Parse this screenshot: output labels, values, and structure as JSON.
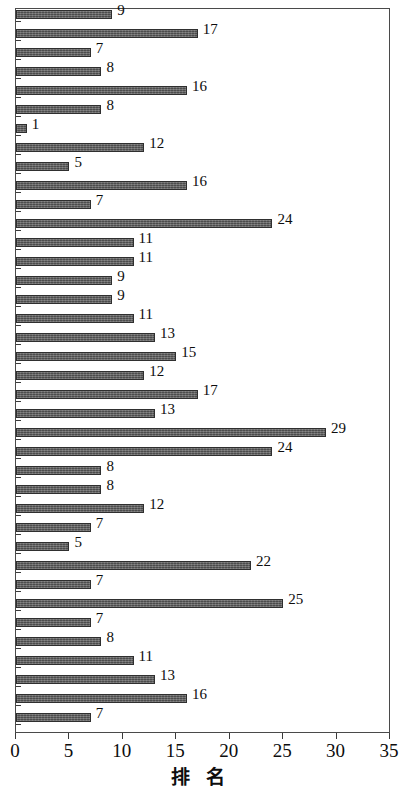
{
  "chart_data": {
    "type": "bar",
    "orientation": "horizontal",
    "title": "",
    "xlabel": "排 名",
    "ylabel": "",
    "xlim": [
      0,
      35
    ],
    "xticks": [
      0,
      5,
      10,
      15,
      20,
      25,
      30,
      35
    ],
    "xtick_labels": [
      "0",
      "5",
      "10",
      "15",
      "20",
      "25",
      "30",
      "35"
    ],
    "grid": false,
    "legend": null,
    "bar_color": "#5d5d5d",
    "bar_edge_color": "#2f2f2f",
    "series": [
      {
        "name": "排名",
        "values": [
          9,
          17,
          7,
          8,
          16,
          8,
          1,
          12,
          5,
          16,
          7,
          24,
          11,
          11,
          9,
          9,
          11,
          13,
          15,
          12,
          17,
          13,
          29,
          24,
          8,
          8,
          12,
          7,
          5,
          22,
          7,
          25,
          7,
          8,
          11,
          13,
          16,
          7
        ]
      }
    ],
    "data_labels": [
      "9",
      "17",
      "7",
      "8",
      "16",
      "8",
      "1",
      "12",
      "5",
      "16",
      "7",
      "24",
      "11",
      "11",
      "9",
      "9",
      "11",
      "13",
      "15",
      "12",
      "17",
      "13",
      "29",
      "24",
      "8",
      "8",
      "12",
      "7",
      "5",
      "22",
      "7",
      "25",
      "7",
      "8",
      "11",
      "13",
      "16",
      "7"
    ],
    "bar_count": 38
  }
}
